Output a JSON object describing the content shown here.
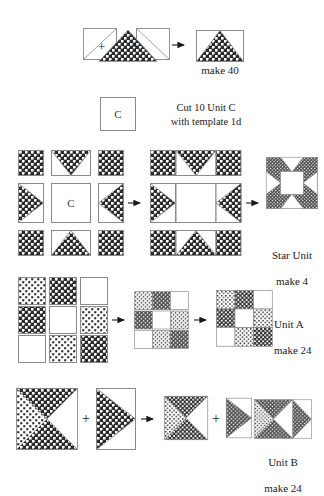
{
  "page": {
    "width": 324,
    "height": 490
  },
  "palette": {
    "dark_fabric": "#2b2b2b",
    "dark_fabric_dot": "#ffffff",
    "light_fabric": "#ffffff",
    "light_fabric_dot": "#2b2b2b",
    "plain_fabric": "#ffffff",
    "outline": "#8a8a8a",
    "ink": "#1a1a1a"
  },
  "steps": [
    {
      "id": "flying-geese",
      "name": "Flying Geese Unit",
      "caption": "make 40",
      "operators": [
        "+",
        "+"
      ],
      "arrow": "→"
    },
    {
      "id": "unit-c",
      "name": "Unit C Square",
      "square_label": "C",
      "instruction_line1": "Cut 10 Unit C",
      "instruction_line2": "with template 1d",
      "instruction": "Cut 10 Unit C\nwith template 1d"
    },
    {
      "id": "star-unit",
      "name": "Star Unit",
      "caption_line1": "Star Unit",
      "caption_line2": "make 4",
      "caption": "Star Unit\nmake 4",
      "center_label": "C",
      "arrow1": "→",
      "arrow2": "→"
    },
    {
      "id": "unit-a",
      "name": "Unit A Nine Patch",
      "caption_line1": "Unit A",
      "caption_line2": "make 24",
      "caption": "Unit A\nmake 24",
      "arrow1": "→",
      "arrow2": "→"
    },
    {
      "id": "unit-b",
      "name": "Unit B Hourglass",
      "caption_line1": "Unit B",
      "caption_line2": "make 24",
      "caption": "Unit B\nmake 24",
      "operator1": "+",
      "operator2": "+",
      "arrow1": "→",
      "arrow2": "→"
    }
  ]
}
